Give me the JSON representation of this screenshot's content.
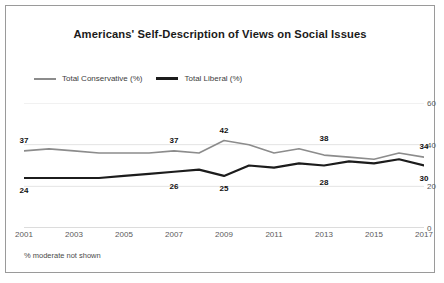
{
  "figure": {
    "title": "Americans' Self-Description of Views on Social Issues",
    "footnote": "% moderate not shown"
  },
  "legend": {
    "items": [
      {
        "label": "Total Conservative (%)",
        "color": "#8c8c8c"
      },
      {
        "label": "Total Liberal (%)",
        "color": "#1c1c1c"
      }
    ]
  },
  "axis": {
    "y_ticks": [
      "0",
      "20",
      "40",
      "60"
    ],
    "x_ticks": [
      "2001",
      "2003",
      "2005",
      "2007",
      "2009",
      "2011",
      "2013",
      "2015",
      "2017"
    ]
  },
  "chart_data": {
    "type": "line",
    "title": "Americans' Self-Description of Views on Social Issues",
    "xlabel": "",
    "ylabel": "",
    "ylim": [
      0,
      60
    ],
    "yticks": [
      0,
      20,
      40,
      60
    ],
    "grid": true,
    "legend_position": "top-left",
    "annotation": "% moderate not shown",
    "x": [
      2001,
      2002,
      2003,
      2004,
      2005,
      2006,
      2007,
      2008,
      2009,
      2010,
      2011,
      2012,
      2013,
      2014,
      2015,
      2016,
      2017
    ],
    "series": [
      {
        "name": "Total Conservative (%)",
        "color": "#8c8c8c",
        "values": [
          37,
          38,
          37,
          36,
          36,
          36,
          37,
          36,
          42,
          40,
          36,
          38,
          35,
          34,
          33,
          36,
          34
        ],
        "labels": [
          {
            "x": 2001,
            "value": 37
          },
          {
            "x": 2007,
            "value": 37
          },
          {
            "x": 2009,
            "value": 42
          },
          {
            "x": 2013,
            "value": 38
          },
          {
            "x": 2017,
            "value": 34
          }
        ]
      },
      {
        "name": "Total Liberal (%)",
        "color": "#1c1c1c",
        "values": [
          24,
          24,
          24,
          24,
          25,
          26,
          27,
          28,
          25,
          30,
          29,
          31,
          30,
          32,
          31,
          33,
          30
        ],
        "labels": [
          {
            "x": 2001,
            "value": 24
          },
          {
            "x": 2007,
            "value": 26
          },
          {
            "x": 2009,
            "value": 25
          },
          {
            "x": 2013,
            "value": 28
          },
          {
            "x": 2017,
            "value": 30
          }
        ]
      }
    ]
  }
}
